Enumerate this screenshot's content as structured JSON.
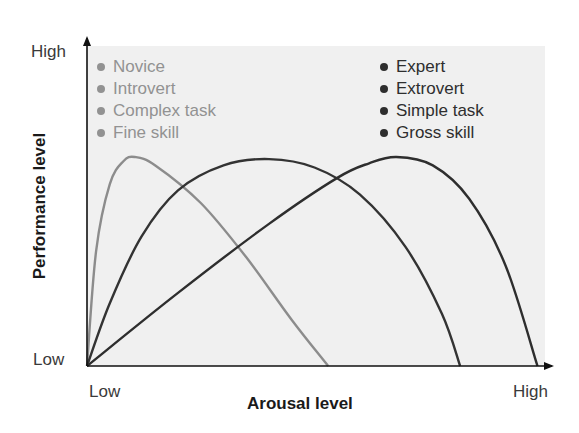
{
  "chart_data": {
    "type": "line",
    "title": "",
    "xlabel": "Arousal level",
    "ylabel": "Performance level",
    "x_ticks": [
      "Low",
      "High"
    ],
    "y_ticks": [
      "Low",
      "High"
    ],
    "xlim": [
      0,
      1
    ],
    "ylim": [
      0,
      1
    ],
    "grid": false,
    "legend_groups": [
      {
        "position": "top-left",
        "color": "#929292",
        "entries": [
          "Novice",
          "Introvert",
          "Complex task",
          "Fine skill"
        ]
      },
      {
        "position": "top-right",
        "color": "#2e2e2e",
        "entries": [
          "Expert",
          "Extrovert",
          "Simple task",
          "Gross skill"
        ]
      }
    ],
    "series": [
      {
        "name": "Novice / Introvert / Complex task / Fine skill",
        "color": "#8c8c8c",
        "x": [
          0.0,
          0.02,
          0.05,
          0.08,
          0.105,
          0.15,
          0.25,
          0.35,
          0.45,
          0.53
        ],
        "y": [
          0.0,
          0.55,
          0.87,
          0.98,
          1.0,
          0.96,
          0.78,
          0.52,
          0.22,
          0.0
        ]
      },
      {
        "name": "Middle arousal curve",
        "color": "#333333",
        "x": [
          0.0,
          0.05,
          0.12,
          0.2,
          0.3,
          0.4,
          0.5,
          0.6,
          0.7,
          0.78,
          0.82
        ],
        "y": [
          0.0,
          0.3,
          0.62,
          0.84,
          0.96,
          0.99,
          0.95,
          0.82,
          0.57,
          0.25,
          0.0
        ]
      },
      {
        "name": "Expert / Extrovert / Simple task / Gross skill",
        "color": "#2e2e2e",
        "x": [
          0.0,
          0.2,
          0.4,
          0.55,
          0.62,
          0.68,
          0.76,
          0.84,
          0.92,
          0.99
        ],
        "y": [
          0.0,
          0.35,
          0.68,
          0.9,
          0.97,
          1.0,
          0.96,
          0.8,
          0.48,
          0.0
        ]
      }
    ]
  }
}
